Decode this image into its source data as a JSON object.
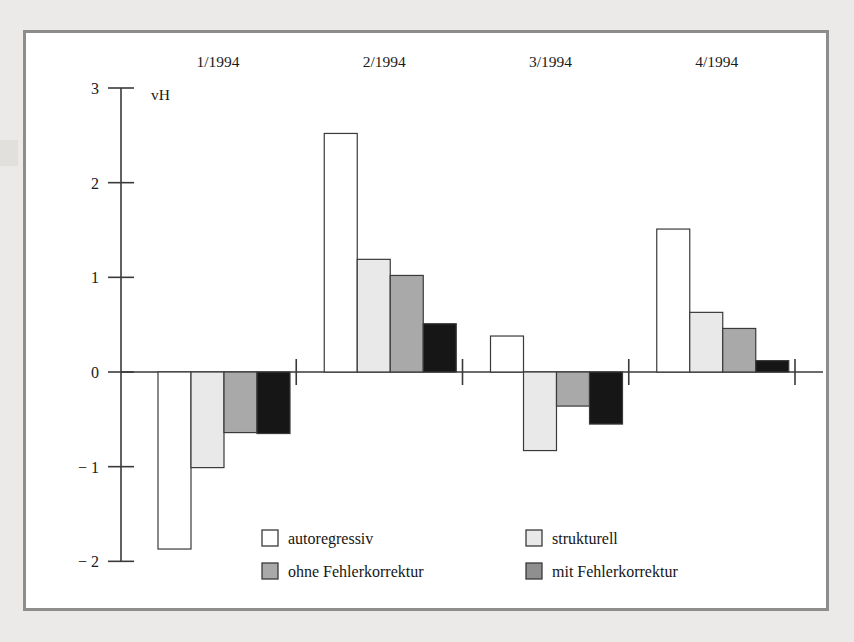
{
  "figure": {
    "unit_label": "vH",
    "frame_color": "#8d8d8d",
    "page_background": "#eceae8",
    "plot_background": "#ffffff",
    "axis_color": "#3a3a3a"
  },
  "legend": {
    "entries": [
      {
        "label": "autoregressiv",
        "color": "#ffffff",
        "swatch_name": "legend-swatch-autoregressiv"
      },
      {
        "label": "strukturell",
        "color": "#e9e9e9",
        "swatch_name": "legend-swatch-strukturell"
      },
      {
        "label": "ohne Fehlerkorrektur",
        "color": "#a9a9a9",
        "swatch_name": "legend-swatch-ohne-fehlerkorrektur"
      },
      {
        "label": "mit Fehlerkorrektur",
        "color": "#8f8f8f",
        "swatch_name": "legend-swatch-mit-fehlerkorrektur"
      }
    ]
  },
  "chart_data": {
    "type": "bar",
    "title": "",
    "subtitle": "",
    "xlabel": "",
    "ylabel": "vH",
    "categories": [
      "1/1994",
      "2/1994",
      "3/1994",
      "4/1994"
    ],
    "category_label_position": "top",
    "ylim": [
      -2,
      3
    ],
    "yticks": [
      3,
      2,
      1,
      0,
      -1,
      -2
    ],
    "ytick_labels": [
      "3",
      "2",
      "1",
      "0",
      "− 1",
      "− 2"
    ],
    "grid": false,
    "legend_position": "bottom",
    "zero_line": 0,
    "series": [
      {
        "name": "autoregressiv",
        "color": "#ffffff",
        "values": [
          -1.87,
          2.52,
          0.38,
          1.51
        ]
      },
      {
        "name": "strukturell",
        "color": "#e9e9e9",
        "values": [
          -1.01,
          1.19,
          -0.83,
          0.63
        ]
      },
      {
        "name": "ohne Fehlerkorrektur",
        "color": "#a9a9a9",
        "values": [
          -0.64,
          1.02,
          -0.36,
          0.46
        ]
      },
      {
        "name": "mit Fehlerkorrektur",
        "color": "#161616",
        "values": [
          -0.65,
          0.51,
          -0.55,
          0.12
        ]
      }
    ]
  }
}
